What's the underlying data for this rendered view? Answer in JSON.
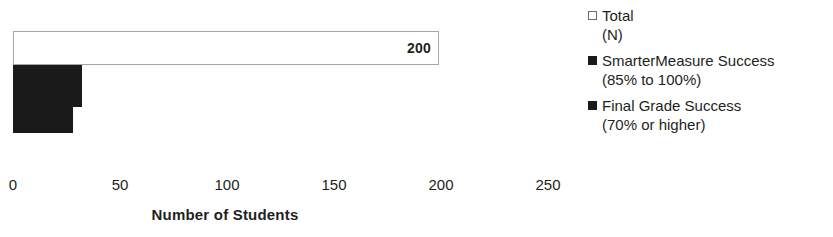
{
  "chart_data": {
    "type": "bar",
    "orientation": "horizontal",
    "title": "",
    "xlabel": "Number of Students",
    "ylabel": "",
    "xlim": [
      0,
      250
    ],
    "xticks": [
      0,
      50,
      100,
      150,
      200,
      250
    ],
    "xtick_labels": [
      "0",
      "50",
      "100",
      "150",
      "200",
      "250"
    ],
    "grid": false,
    "legend_position": "right",
    "categories": [
      "Total (N)",
      "SmarterMeasure Success (85% to 100%)",
      "Final Grade Success (70% or higher)"
    ],
    "values": [
      200,
      32,
      28
    ],
    "data_labels": [
      "200",
      "",
      ""
    ],
    "series": [
      {
        "name": "Total (N)",
        "value": 200,
        "label": "200",
        "fill": "#ffffff",
        "stroke": "#a6a6a6"
      },
      {
        "name": "SmarterMeasure Success (85% to 100%)",
        "value": 32,
        "label": "",
        "fill": "#1a1a1a",
        "stroke": "#1a1a1a"
      },
      {
        "name": "Final Grade Success (70% or higher)",
        "value": 28,
        "label": "",
        "fill": "#1a1a1a",
        "stroke": "#1a1a1a"
      }
    ]
  },
  "axis": {
    "title": "Number of Students",
    "ticks": [
      {
        "label": "0",
        "x": 13
      },
      {
        "label": "50",
        "x": 120
      },
      {
        "label": "100",
        "x": 227
      },
      {
        "label": "150",
        "x": 334
      },
      {
        "label": "200",
        "x": 441
      },
      {
        "label": "250",
        "x": 548
      }
    ]
  },
  "bars": {
    "total": {
      "label": "200",
      "width_px": 426
    },
    "smartermeasure": {
      "label": "",
      "width_px": 69
    },
    "final_grade": {
      "label": "",
      "width_px": 60
    }
  },
  "legend": {
    "items": [
      {
        "marker": "open-square",
        "label": "Total",
        "sublabel": "(N)"
      },
      {
        "marker": "filled-square",
        "label": "SmarterMeasure Success",
        "sublabel": "(85% to 100%)"
      },
      {
        "marker": "filled-square",
        "label": "Final Grade Success",
        "sublabel": "(70% or higher)"
      }
    ]
  }
}
